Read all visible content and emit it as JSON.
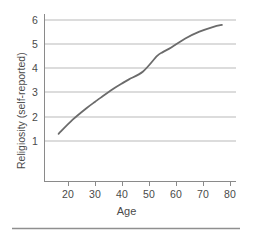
{
  "chart_data": {
    "type": "line",
    "title": "",
    "xlabel": "Age",
    "ylabel": "Religiosity (self-reported)",
    "xlim": [
      15,
      83
    ],
    "ylim": [
      0.25,
      6.4
    ],
    "xticks": [
      20,
      30,
      40,
      50,
      60,
      70,
      80
    ],
    "yticks": [
      1,
      2,
      3,
      4,
      5,
      6
    ],
    "grid": "horizontal",
    "legend": "none",
    "series": [
      {
        "name": "Religiosity by age",
        "color": "#6b6b6b",
        "x": [
          20,
          25,
          30,
          33,
          35,
          40,
          43,
          45,
          50,
          55,
          57,
          60,
          65,
          70,
          75,
          78
        ],
        "y": [
          2.0,
          2.52,
          2.95,
          3.18,
          3.33,
          3.69,
          3.88,
          4.0,
          4.29,
          4.86,
          5.0,
          5.17,
          5.5,
          5.75,
          5.93,
          6.0
        ]
      }
    ]
  },
  "axis": {
    "xtick_labels": [
      "20",
      "30",
      "40",
      "50",
      "60",
      "70",
      "80"
    ],
    "ytick_labels": [
      "1",
      "2",
      "3",
      "4",
      "5",
      "6"
    ],
    "x_title": "Age",
    "y_title": "Religiosity (self-reported)"
  },
  "colors": {
    "curve": "#6b6b6b",
    "grid": "#b9b9b9",
    "axis": "#8a8a8a",
    "rule": "#8f8f8f",
    "text": "#4a4a4a"
  }
}
